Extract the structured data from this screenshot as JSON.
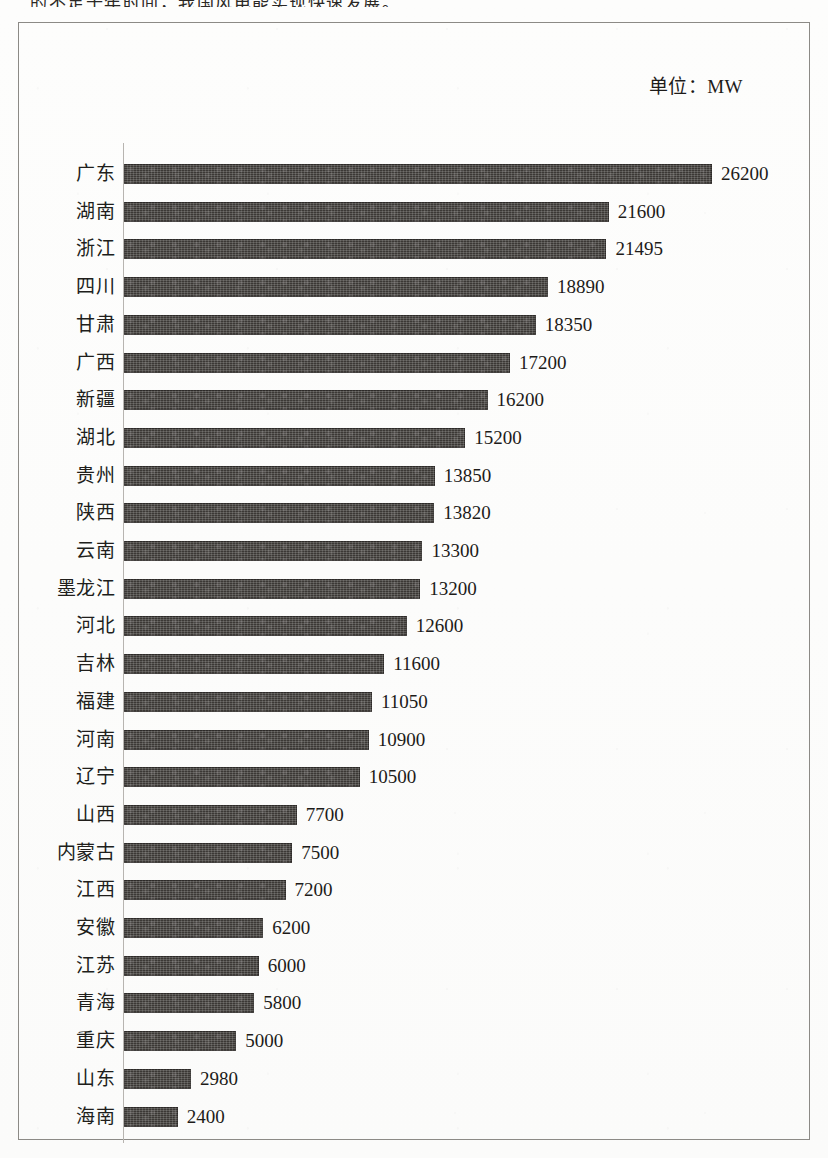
{
  "page": {
    "top_cut_text": "的不足十年时间，我国风电能实现快速发展。"
  },
  "chart": {
    "unit_label": "单位：MW"
  },
  "chart_data": {
    "type": "bar",
    "orientation": "horizontal",
    "title": "",
    "subtitle": "",
    "unit": "MW",
    "xlabel": "",
    "ylabel": "",
    "grid": false,
    "legend": null,
    "axis_max": 26200,
    "annotations": [
      "单位：MW"
    ],
    "categories": [
      "广东",
      "湖南",
      "浙江",
      "四川",
      "甘肃",
      "广西",
      "新疆",
      "湖北",
      "贵州",
      "陕西",
      "云南",
      "墨龙江",
      "河北",
      "吉林",
      "福建",
      "河南",
      "辽宁",
      "山西",
      "内蒙古",
      "江西",
      "安徽",
      "江苏",
      "青海",
      "重庆",
      "山东",
      "海南"
    ],
    "values": [
      26200,
      21600,
      21495,
      18890,
      18350,
      17200,
      16200,
      15200,
      13850,
      13820,
      13300,
      13200,
      12600,
      11600,
      11050,
      10900,
      10500,
      7700,
      7500,
      7200,
      6200,
      6000,
      5800,
      5000,
      2980,
      2400
    ],
    "value_labels": [
      "26200",
      "21600",
      "21495",
      "18890",
      "18350",
      "17200",
      "16200",
      "15200",
      "13850",
      "13820",
      "13300",
      "13200",
      "12600",
      "11600",
      "11050",
      "10900",
      "10500",
      "7700",
      "7500",
      "7200",
      "6200",
      "6000",
      "5800",
      "5000",
      "2980",
      "2400"
    ],
    "colors": {
      "bar": "#3b3835",
      "frame": "#8c8a86",
      "axis": "#b7b4b0",
      "text": "#1d1b19",
      "background": "#fdfdfc"
    }
  }
}
